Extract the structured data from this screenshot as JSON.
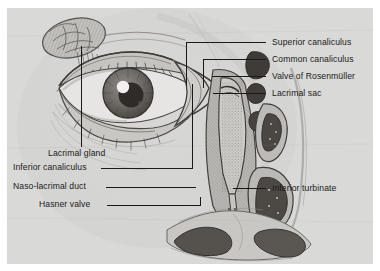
{
  "figure": {
    "kind": "anatomical-illustration",
    "background_color": "#d9d9d7",
    "page_color": "#ffffff",
    "ink_color": "#1a1a1a"
  },
  "labels_right": [
    {
      "id": "superior-canaliculus",
      "text": "Superior canaliculus",
      "x": 272,
      "y": 38,
      "leader_y": 42,
      "leader_from": 266,
      "leader_to": 186,
      "drop_to": 86
    },
    {
      "id": "common-canaliculus",
      "text": "Common canaliculus",
      "x": 272,
      "y": 55,
      "leader_y": 59,
      "leader_from": 266,
      "leader_to": 203,
      "drop_to": 88
    },
    {
      "id": "valve-of-rosenmuller",
      "text": "Valve of Rosenmüller",
      "x": 272,
      "y": 72,
      "leader_y": 76,
      "leader_from": 266,
      "leader_to": 212,
      "drop_to": 76
    },
    {
      "id": "lacrimal-sac",
      "text": "Lacrimal sac",
      "x": 272,
      "y": 89,
      "leader_y": 93,
      "leader_from": 266,
      "leader_to": 213,
      "drop_to": 93
    },
    {
      "id": "inferior-turbinate",
      "text": "Inferior turbinate",
      "x": 272,
      "y": 184,
      "leader_y": 188,
      "leader_from": 266,
      "leader_to": 233,
      "drop_to": 188
    }
  ],
  "labels_left": [
    {
      "id": "lacrimal-gland",
      "text": "Lacrimal gland",
      "x": 48,
      "y": 149,
      "leader_x": 81,
      "leader_from": 147,
      "leader_to": 46
    },
    {
      "id": "inferior-canaliculus",
      "text": "Inferior canaliculus",
      "x": 13,
      "y": 163,
      "leader_y": 168,
      "leader_from": 101,
      "leader_to": 192,
      "rise_to": 84
    },
    {
      "id": "naso-lacrimal-duct",
      "text": "Naso-lacrimal duct",
      "x": 13,
      "y": 182,
      "leader_y": 187,
      "leader_from": 106,
      "leader_to": 196
    },
    {
      "id": "hasner-valve",
      "text": "Hasner valve",
      "x": 39,
      "y": 200,
      "leader_y": 205,
      "leader_from": 107,
      "leader_to": 200,
      "rise_to": 197
    }
  ],
  "structures": [
    {
      "id": "lacrimal-gland-body",
      "name": "Lacrimal gland (lobulated almond body, superolateral orbit)"
    },
    {
      "id": "eyeball",
      "name": "Eyeball with iris, pupil and corneal highlight"
    },
    {
      "id": "eyelids",
      "name": "Upper and lower eyelids with lashes"
    },
    {
      "id": "medial-canthus",
      "name": "Medial canthus / lacrimal lake cutaway"
    },
    {
      "id": "lacrimal-sac-lumen",
      "name": "Lacrimal sac lumen"
    },
    {
      "id": "nasolacrimal-duct",
      "name": "Naso-lacrimal duct descending into inferior meatus"
    },
    {
      "id": "inferior-turbinate-body",
      "name": "Inferior turbinate (scrolled mucosa)"
    },
    {
      "id": "middle-turbinate-body",
      "name": "Middle turbinate"
    },
    {
      "id": "nose-nostrils",
      "name": "External nose with nostrils"
    }
  ]
}
